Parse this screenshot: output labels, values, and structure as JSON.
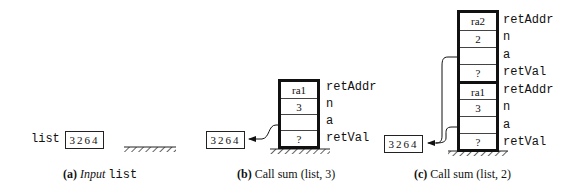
{
  "panel_a": {
    "var_label": "list",
    "array": "3264",
    "caption_letter": "(a)",
    "caption_italic": "Input",
    "caption_mono": "list"
  },
  "panel_b": {
    "array": "3264",
    "rows": [
      {
        "value": "ra1",
        "label": "retAddr"
      },
      {
        "value": "3",
        "label": "n"
      },
      {
        "value": "",
        "label": "a"
      },
      {
        "value": "?",
        "label": "retVal"
      }
    ],
    "caption_letter": "(b)",
    "caption_text": "Call sum (list, 3)"
  },
  "panel_c": {
    "array": "3264",
    "rows": [
      {
        "value": "ra2",
        "label": "retAddr"
      },
      {
        "value": "2",
        "label": "n"
      },
      {
        "value": "",
        "label": "a"
      },
      {
        "value": "?",
        "label": "retVal"
      },
      {
        "value": "ra1",
        "label": "retAddr"
      },
      {
        "value": "3",
        "label": "n"
      },
      {
        "value": "",
        "label": "a"
      },
      {
        "value": "?",
        "label": "retVal"
      }
    ],
    "caption_letter": "(c)",
    "caption_text": "Call sum (list, 2)"
  }
}
